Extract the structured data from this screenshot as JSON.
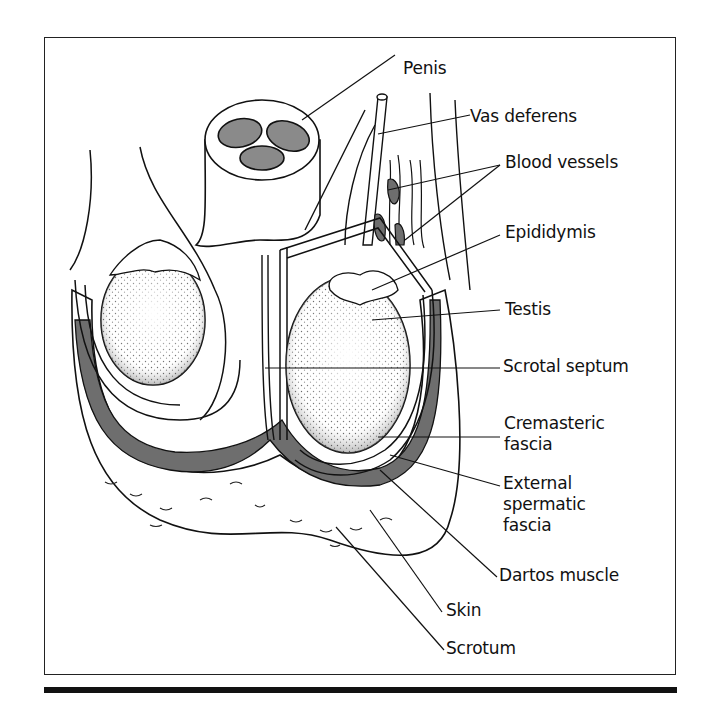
{
  "diagram": {
    "type": "anatomical-illustration",
    "colors": {
      "line": "#111111",
      "tissue_gray": "#8a8a8a",
      "muscle_gray": "#6e6e6e",
      "background": "#ffffff"
    },
    "labels": {
      "penis": "Penis",
      "vas_deferens": "Vas deferens",
      "blood_vessels": "Blood vessels",
      "epididymis": "Epididymis",
      "testis": "Testis",
      "scrotal_septum": "Scrotal septum",
      "cremasteric_fascia": [
        "Cremasteric",
        "fascia"
      ],
      "external_spermatic_fascia": [
        "External",
        "spermatic",
        "fascia"
      ],
      "dartos_muscle": "Dartos muscle",
      "skin": "Skin",
      "scrotum": "Scrotum"
    }
  }
}
